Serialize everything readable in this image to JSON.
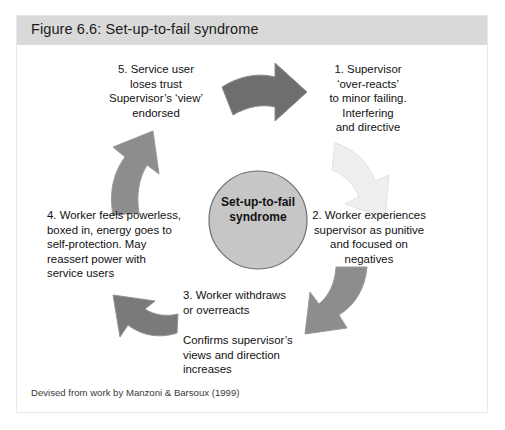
{
  "figure": {
    "header_title": "Figure 6.6: Set-up-to-fail syndrome",
    "footer_note": "Devised from work by Manzoni & Barsoux (1999)",
    "hub_label": "Set-up-to-fail\nsyndrome",
    "colors": {
      "header_band": "#d9d9d9",
      "card_background": "#ffffff",
      "card_border": "#e9e9ea",
      "hub_fill": "#c6c6c6",
      "hub_stroke": "#6f6f6f",
      "arrow_dark": "#6e6e6e",
      "arrow_medium": "#8d8d8d",
      "arrow_light": "#efefef",
      "arrow_stroke": "#9a9a9a",
      "text": "#111111"
    }
  },
  "steps": [
    {
      "id": "step-1",
      "number": "1",
      "text": "1. Supervisor\n‘over-reacts’\nto minor failing.\nInterfering\nand directive",
      "align": "center",
      "arrow": {
        "name": "arrow-step-5-to-1",
        "direction": "right",
        "shade": "dark"
      }
    },
    {
      "id": "step-2",
      "number": "2",
      "text": "2. Worker experiences\nsupervisor as punitive\nand focused on\nnegatives",
      "align": "center",
      "arrow": {
        "name": "arrow-step-1-to-2",
        "direction": "down-right",
        "shade": "light"
      }
    },
    {
      "id": "step-3",
      "number": "3",
      "text": "3. Worker withdraws\nor overreacts",
      "text_secondary": "Confirms supervisor’s\nviews and direction\nincreases",
      "align": "left",
      "arrow": {
        "name": "arrow-step-2-to-3",
        "direction": "down-left",
        "shade": "medium"
      }
    },
    {
      "id": "step-4",
      "number": "4",
      "text": "4. Worker feels powerless,\nboxed in, energy goes to\nself-protection. May\nreassert power with\nservice users",
      "align": "left",
      "arrow": {
        "name": "arrow-step-3-to-4",
        "direction": "up-left",
        "shade": "medium"
      }
    },
    {
      "id": "step-5",
      "number": "5",
      "text": "5. Service user\nloses trust\nSupervisor’s ‘view’\nendorsed",
      "align": "center",
      "arrow": {
        "name": "arrow-step-4-to-5",
        "direction": "up",
        "shade": "medium"
      }
    }
  ]
}
